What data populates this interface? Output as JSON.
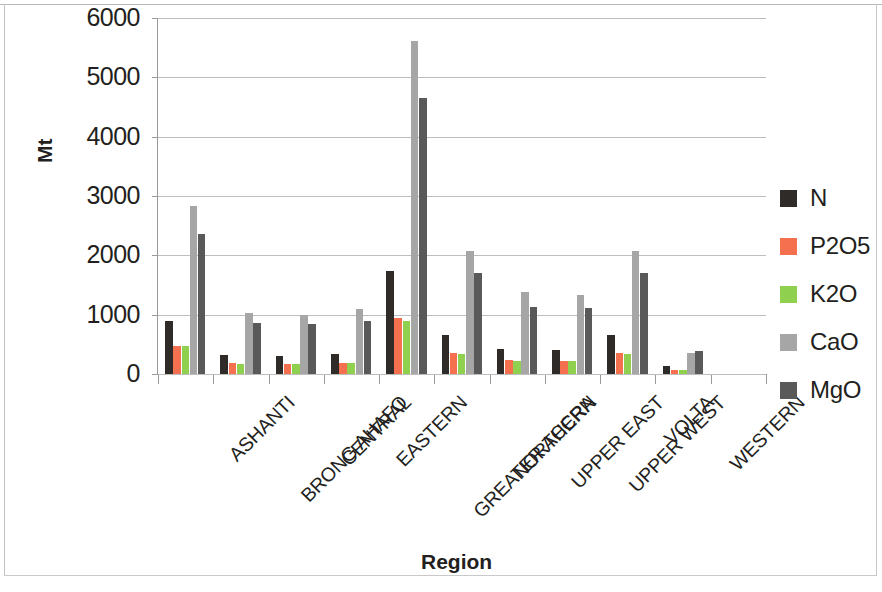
{
  "chart_data": {
    "type": "bar",
    "title": "",
    "xlabel": "Region",
    "ylabel": "Mt",
    "ylim": [
      0,
      6000
    ],
    "ytick_values": [
      0,
      1000,
      2000,
      3000,
      4000,
      5000,
      6000
    ],
    "ytick_labels": [
      "0",
      "1000",
      "2000",
      "3000",
      "4000",
      "5000",
      "6000"
    ],
    "grid": true,
    "legend_position": "right",
    "categories": [
      "ASHANTI",
      "BRONG AHAFO",
      "CENTRAL",
      "EASTERN",
      "GREATER ACCRA",
      "NORTHERN",
      "UPPER EAST",
      "UPPER WEST",
      "VOLTA",
      "WESTERN"
    ],
    "series": [
      {
        "name": "N",
        "color": "#2f2b28",
        "values": [
          900,
          320,
          310,
          330,
          1740,
          650,
          430,
          400,
          660,
          130
        ]
      },
      {
        "name": "P2O5",
        "color": "#f4704f",
        "values": [
          480,
          180,
          170,
          190,
          950,
          350,
          230,
          225,
          350,
          70
        ]
      },
      {
        "name": "K2O",
        "color": "#8fd14f",
        "values": [
          470,
          175,
          170,
          190,
          900,
          340,
          225,
          220,
          345,
          70
        ]
      },
      {
        "name": "CaO",
        "color": "#a6a6a6",
        "values": [
          2830,
          1030,
          1000,
          1090,
          5610,
          2070,
          1380,
          1330,
          2070,
          350
        ]
      },
      {
        "name": "MgO",
        "color": "#595959",
        "values": [
          2360,
          860,
          840,
          900,
          4660,
          1710,
          1130,
          1110,
          1710,
          390
        ]
      }
    ]
  },
  "legend": {
    "items": [
      {
        "label": "N",
        "color": "#2f2b28"
      },
      {
        "label": "P2O5",
        "color": "#f4704f"
      },
      {
        "label": "K2O",
        "color": "#8fd14f"
      },
      {
        "label": "CaO",
        "color": "#a6a6a6"
      },
      {
        "label": "MgO",
        "color": "#595959"
      }
    ]
  },
  "axis": {
    "y_title": "Mt",
    "x_title": "Region"
  }
}
